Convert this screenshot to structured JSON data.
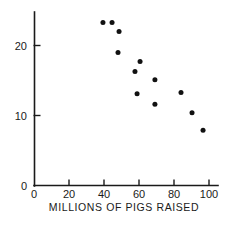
{
  "chart_data": {
    "type": "scatter",
    "title": "",
    "subtitle": "",
    "xlabel": "MILLIONS OF PIGS RAISED",
    "ylabel": "",
    "xlim": [
      0,
      104
    ],
    "ylim": [
      0,
      25
    ],
    "xticks": [
      0,
      20,
      40,
      60,
      80,
      100
    ],
    "xticklabels": [
      "0",
      "20",
      "40",
      "60",
      "80",
      "100"
    ],
    "yticks": [
      0,
      10,
      20
    ],
    "yticklabels": [
      "0",
      "10",
      "20"
    ],
    "grid": false,
    "legend": null,
    "marker": "filled-circle",
    "marker_color": "#111111",
    "points": [
      {
        "x": 39.4,
        "y": 23.3
      },
      {
        "x": 44.6,
        "y": 23.3
      },
      {
        "x": 48.6,
        "y": 22.0
      },
      {
        "x": 48.0,
        "y": 19.0
      },
      {
        "x": 60.6,
        "y": 17.7
      },
      {
        "x": 57.7,
        "y": 16.3
      },
      {
        "x": 69.1,
        "y": 15.1
      },
      {
        "x": 58.9,
        "y": 13.1
      },
      {
        "x": 84.0,
        "y": 13.3
      },
      {
        "x": 69.1,
        "y": 11.6
      },
      {
        "x": 90.3,
        "y": 10.4
      },
      {
        "x": 96.6,
        "y": 7.9
      }
    ]
  },
  "axis": {
    "x_title": "MILLIONS OF PIGS RAISED"
  }
}
